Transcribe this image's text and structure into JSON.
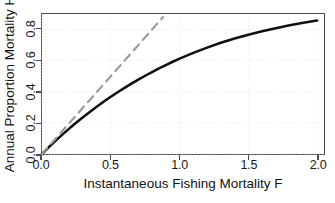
{
  "chart_data": {
    "type": "line",
    "title": "",
    "subtitle": "",
    "xlabel": "Instantaneous Fishing Mortality F",
    "ylabel": "Annual Proportion Mortality H",
    "xlim": [
      0.0,
      2.05
    ],
    "ylim": [
      0.0,
      0.9
    ],
    "xticks": [
      0.0,
      0.5,
      1.0,
      1.5,
      2.0
    ],
    "xtick_labels": [
      "0.0",
      "0.5",
      "1.0",
      "1.5",
      "2.0"
    ],
    "yticks": [
      0.0,
      0.2,
      0.4,
      0.6,
      0.8
    ],
    "ytick_labels": [
      "0.0",
      "0.2",
      "0.4",
      "0.6",
      "0.8"
    ],
    "grid": true,
    "grid_style": "dotted",
    "grid_color": "#e8e8e8",
    "legend": null,
    "legend_position": "none",
    "frame": true,
    "frame_color": "#4a4a4a",
    "background": "#ffffff",
    "series": [
      {
        "name": "Annual proportion mortality",
        "style": "solid",
        "color": "#111111",
        "width": 2.6,
        "x": [
          0.0,
          0.05,
          0.1,
          0.15,
          0.2,
          0.25,
          0.3,
          0.35,
          0.4,
          0.45,
          0.5,
          0.55,
          0.6,
          0.65,
          0.7,
          0.75,
          0.8,
          0.85,
          0.9,
          0.95,
          1.0,
          1.1,
          1.2,
          1.3,
          1.4,
          1.5,
          1.6,
          1.7,
          1.8,
          1.9,
          2.0
        ],
        "values": [
          0.0,
          0.044,
          0.086,
          0.126,
          0.165,
          0.202,
          0.238,
          0.272,
          0.305,
          0.337,
          0.368,
          0.397,
          0.425,
          0.452,
          0.478,
          0.503,
          0.527,
          0.55,
          0.572,
          0.593,
          0.613,
          0.65,
          0.684,
          0.715,
          0.742,
          0.767,
          0.789,
          0.809,
          0.827,
          0.843,
          0.858
        ]
      },
      {
        "name": "1:1 reference line",
        "style": "dashed",
        "color": "#9a9a9a",
        "width": 2.2,
        "x": [
          0.0,
          0.88
        ],
        "values": [
          0.0,
          0.88
        ]
      }
    ]
  },
  "axes": {
    "x": {
      "label": "Instantaneous Fishing Mortality F",
      "ticks": [
        {
          "value": 0.0,
          "label": "0.0"
        },
        {
          "value": 0.5,
          "label": "0.5"
        },
        {
          "value": 1.0,
          "label": "1.0"
        },
        {
          "value": 1.5,
          "label": "1.5"
        },
        {
          "value": 2.0,
          "label": "2.0"
        }
      ]
    },
    "y": {
      "label": "Annual Proportion Mortality H",
      "ticks": [
        {
          "value": 0.0,
          "label": "0.0"
        },
        {
          "value": 0.2,
          "label": "0.2"
        },
        {
          "value": 0.4,
          "label": "0.4"
        },
        {
          "value": 0.6,
          "label": "0.6"
        },
        {
          "value": 0.8,
          "label": "0.8"
        }
      ]
    }
  }
}
